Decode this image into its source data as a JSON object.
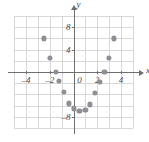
{
  "chart_data": {
    "type": "scatter",
    "title": "",
    "xlabel": "x",
    "ylabel": "y",
    "xlim": [
      -5,
      5
    ],
    "ylim": [
      -10,
      10
    ],
    "xticks": [
      -4,
      -2,
      0,
      2,
      4
    ],
    "yticks": [
      8,
      4,
      0,
      -8
    ],
    "xtick_labels": [
      "–4",
      "–2",
      "0",
      "2",
      "4"
    ],
    "ytick_labels": [
      "8",
      "4",
      "0",
      "–8"
    ],
    "grid": true,
    "grid_step_x": 1,
    "grid_step_y": 2,
    "legend": "none",
    "point_color": "#8e8e96",
    "axis_color": "#6f6f6f",
    "grid_color": "#d8d8d8",
    "points": [
      {
        "x": -2.5,
        "y": 6
      },
      {
        "x": -2,
        "y": 2.5
      },
      {
        "x": -1.5,
        "y": 0
      },
      {
        "x": -1.2,
        "y": -1.6
      },
      {
        "x": -0.8,
        "y": -3.6
      },
      {
        "x": -0.4,
        "y": -5.6
      },
      {
        "x": 0,
        "y": -6.5
      },
      {
        "x": 0.5,
        "y": -7
      },
      {
        "x": 1,
        "y": -6.8
      },
      {
        "x": 1.4,
        "y": -5.8
      },
      {
        "x": 1.8,
        "y": -3.8
      },
      {
        "x": 2.2,
        "y": -1.8
      },
      {
        "x": 2.6,
        "y": 0
      },
      {
        "x": 3,
        "y": 2.5
      },
      {
        "x": 3.4,
        "y": 6
      }
    ]
  },
  "axes": {
    "x_name": "x",
    "y_name": "y"
  }
}
